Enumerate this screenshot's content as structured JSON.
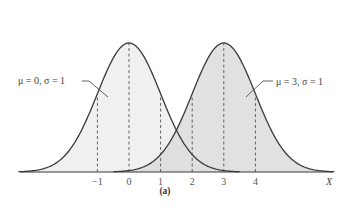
{
  "figure": {
    "caption": "(a)",
    "axis_label": "X",
    "ticks": [
      {
        "value": -1,
        "label": "−1"
      },
      {
        "value": 0,
        "label": "0"
      },
      {
        "value": 1,
        "label": "1"
      },
      {
        "value": 2,
        "label": "2"
      },
      {
        "value": 3,
        "label": "3"
      },
      {
        "value": 4,
        "label": "4"
      }
    ],
    "curves": [
      {
        "name": "left-normal",
        "label": "μ = 0, σ = 1",
        "mu": 0,
        "sigma": 1,
        "fill": "#f0f0f0"
      },
      {
        "name": "right-normal",
        "label": "μ = 3, σ = 1",
        "mu": 3,
        "sigma": 1,
        "fill": "#dcdcdc"
      }
    ],
    "colors": {
      "curve": "#3a3a3a",
      "axis": "#3a3a3a",
      "dash": "#555555",
      "overlap": "#d4d4d4"
    }
  },
  "chart_data": {
    "type": "line",
    "title": "",
    "xlabel": "X",
    "ylabel": "",
    "caption": "(a)",
    "x_ticks": [
      -1,
      0,
      1,
      2,
      3,
      4
    ],
    "xlim": [
      -3.5,
      6.5
    ],
    "series": [
      {
        "name": "μ = 0, σ = 1",
        "mu": 0,
        "sigma": 1,
        "dashed_verticals_at": [
          -1,
          0,
          1
        ]
      },
      {
        "name": "μ = 3, σ = 1",
        "mu": 3,
        "sigma": 1,
        "dashed_verticals_at": [
          2,
          3,
          4
        ]
      }
    ],
    "grid": false,
    "legend": "inline annotations with leader lines"
  }
}
